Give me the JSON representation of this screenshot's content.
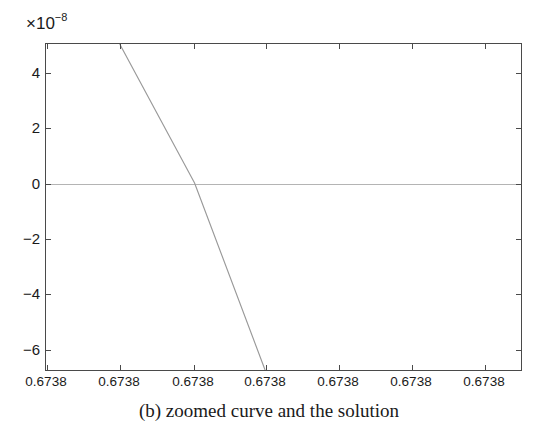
{
  "caption": "(b) zoomed curve and the solution",
  "exponent_label": {
    "prefix": "×10",
    "exponent": "−8"
  },
  "colors": {
    "axis": "#4a4a4a",
    "curve": "#999999",
    "zero_line": "#b4b4b4",
    "text": "#1a1a1a",
    "background": "#ffffff"
  },
  "chart_data": {
    "type": "line",
    "title": "",
    "subtitle": "",
    "xlabel": "",
    "ylabel": "",
    "y_multiplier": "×10−8",
    "y_multiplier_value": 1e-08,
    "grid": false,
    "legend": null,
    "xlim": [
      0.6738,
      0.6738
    ],
    "ylim": [
      -6.8,
      5.05
    ],
    "xticks": [
      "0.6738",
      "0.6738",
      "0.6738",
      "0.6738",
      "0.6738",
      "0.6738",
      "0.6738"
    ],
    "yticks": [
      "4",
      "2",
      "0",
      "−2",
      "−4",
      "−6"
    ],
    "ytick_values": [
      4,
      2,
      0,
      -2,
      -4,
      -6
    ],
    "series": [
      {
        "name": "f(x)",
        "points": [
          {
            "x_index": 1.0,
            "y": 5.05
          },
          {
            "x_index": 2.03,
            "y": 0.0
          },
          {
            "x_index": 3.0,
            "y": -6.8
          }
        ],
        "description": "steeply decreasing near-linear curve crossing zero",
        "root_y": 0.0
      }
    ],
    "annotations": []
  }
}
